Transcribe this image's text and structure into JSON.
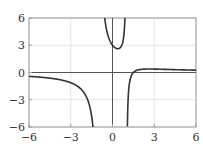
{
  "chart_data": {
    "type": "line",
    "title": "",
    "xlabel": "",
    "ylabel": "",
    "function": "f(x) = (2x - 3) / (x^2 - 1)",
    "xlim": [
      -6,
      6
    ],
    "ylim": [
      -6,
      6
    ],
    "xticks": [
      -6,
      -3,
      0,
      3,
      6
    ],
    "yticks": [
      -6,
      -3,
      0,
      3,
      6
    ],
    "xtick_labels": [
      "−6",
      "−3",
      "0",
      "3",
      "6"
    ],
    "ytick_labels": [
      "−6",
      "−3",
      "0",
      "3",
      "6"
    ],
    "grid": true,
    "legend": null,
    "vertical_asymptotes": [
      -1,
      1
    ],
    "series": [
      {
        "name": "f(x) left branch",
        "x": [
          -6,
          -5,
          -4,
          -3,
          -2.5,
          -2,
          -1.75,
          -1.5,
          -1.4
        ],
        "y": [
          -0.429,
          -0.542,
          -0.733,
          -1.125,
          -1.524,
          -2.333,
          -3.152,
          -4.8,
          -6.04
        ]
      },
      {
        "name": "f(x) middle branch",
        "x": [
          -0.6,
          -0.5,
          -0.4,
          -0.25,
          -0.1,
          0,
          0.15,
          0.25,
          0.38,
          0.5,
          0.6,
          0.75,
          0.85,
          0.9
        ],
        "y": [
          6.56,
          5.333,
          4.524,
          3.733,
          3.232,
          3.0,
          2.762,
          2.667,
          2.618,
          2.667,
          2.812,
          3.429,
          4.604,
          6.316
        ]
      },
      {
        "name": "f(x) right branch",
        "x": [
          1.07,
          1.1,
          1.15,
          1.25,
          1.35,
          1.5,
          1.75,
          2,
          2.62,
          3,
          4,
          5,
          6
        ],
        "y": [
          -5.93,
          -3.81,
          -2.093,
          -0.889,
          -0.364,
          0,
          0.242,
          0.333,
          0.383,
          0.375,
          0.333,
          0.292,
          0.257
        ]
      }
    ],
    "colors": {
      "curve": "#333333",
      "axis": "#555555",
      "grid": "#e6e6e6",
      "frame": "#9a9a9a"
    }
  }
}
